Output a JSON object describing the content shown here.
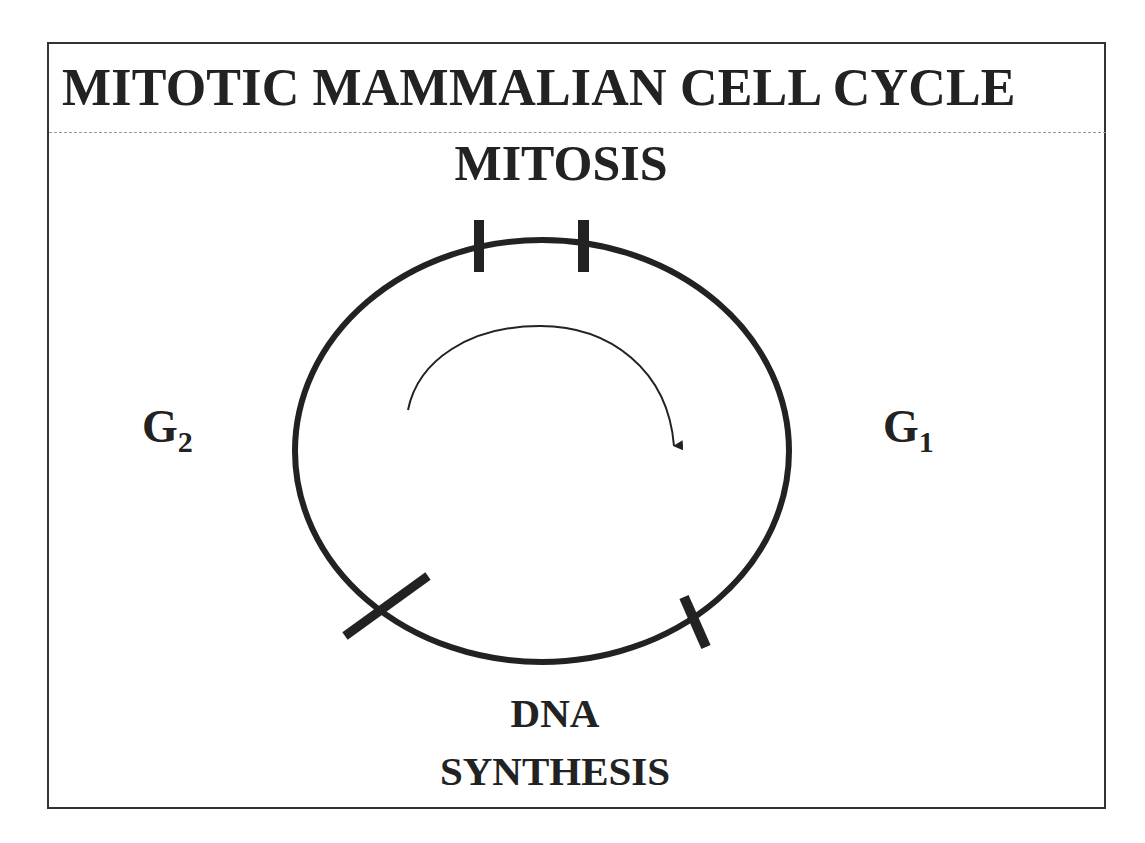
{
  "slide": {
    "title": "MITOTIC MAMMALIAN CELL CYCLE"
  },
  "cycle": {
    "phases": {
      "mitosis": {
        "label": "MITOSIS"
      },
      "g1": {
        "letter": "G",
        "subscript": "1"
      },
      "g2": {
        "letter": "G",
        "subscript": "2"
      },
      "dna_synthesis": {
        "line1": "DNA",
        "line2": "SYNTHESIS"
      }
    },
    "direction": "clockwise",
    "stroke_color": "#222222",
    "boundary_marks": 4
  }
}
